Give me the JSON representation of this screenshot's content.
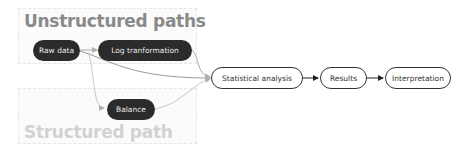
{
  "groups": {
    "unstructured": {
      "title": "Unstructured paths"
    },
    "structured": {
      "title": "Structured path"
    }
  },
  "nodes": {
    "raw_data": "Raw data",
    "log_transformation": "Log tranformation",
    "balance": "Balance",
    "statistical_analysis": "Statistical analysis",
    "results": "Results",
    "interpretation": "Interpretation"
  },
  "colors": {
    "dark_node": "#2b2b2b",
    "edge_gray": "#b0b0b0",
    "edge_dark": "#333333"
  }
}
